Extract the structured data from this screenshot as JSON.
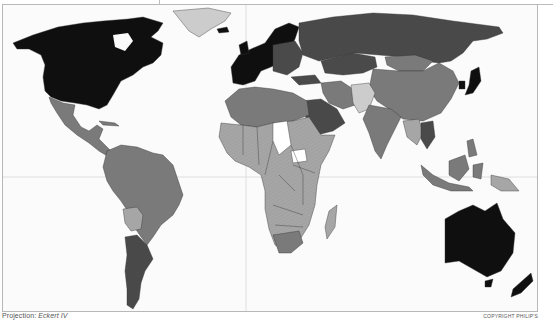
{
  "map": {
    "projection_label": "Projection:",
    "projection_name": "Eckert IV",
    "copyright": "COPYRIGHT PHILIP'S",
    "shading_classes": [
      {
        "id": "c1",
        "color": "#0f0f0f"
      },
      {
        "id": "c2",
        "color": "#4a4a4a"
      },
      {
        "id": "c3",
        "color": "#7a7a7a"
      },
      {
        "id": "c4",
        "color": "#a6a6a6"
      },
      {
        "id": "c5",
        "color": "#cccccc"
      },
      {
        "id": "c6",
        "color": "#ffffff"
      }
    ],
    "regions": [
      {
        "name": "North America (USA & Canada)",
        "class": "c1"
      },
      {
        "name": "Greenland",
        "class": "c5"
      },
      {
        "name": "Western Europe",
        "class": "c1"
      },
      {
        "name": "Russia",
        "class": "c2"
      },
      {
        "name": "Kazakhstan",
        "class": "c2"
      },
      {
        "name": "Mexico & Central America",
        "class": "c3"
      },
      {
        "name": "South America (north)",
        "class": "c3"
      },
      {
        "name": "Brazil",
        "class": "c3"
      },
      {
        "name": "Bolivia",
        "class": "c4"
      },
      {
        "name": "Argentina",
        "class": "c2"
      },
      {
        "name": "North Africa",
        "class": "c3"
      },
      {
        "name": "Sub-Saharan Africa",
        "class": "c4"
      },
      {
        "name": "Chad / Central African Republic",
        "class": "c6"
      },
      {
        "name": "South Africa",
        "class": "c3"
      },
      {
        "name": "Madagascar",
        "class": "c4"
      },
      {
        "name": "Saudi Arabia",
        "class": "c2"
      },
      {
        "name": "Iran",
        "class": "c3"
      },
      {
        "name": "Afghanistan / Pakistan",
        "class": "c5"
      },
      {
        "name": "India",
        "class": "c3"
      },
      {
        "name": "China",
        "class": "c3"
      },
      {
        "name": "Mongolia",
        "class": "c3"
      },
      {
        "name": "Japan / South Korea",
        "class": "c1"
      },
      {
        "name": "Southeast Asia",
        "class": "c3"
      },
      {
        "name": "Thailand",
        "class": "c2"
      },
      {
        "name": "Indonesia",
        "class": "c3"
      },
      {
        "name": "Papua New Guinea",
        "class": "c4"
      },
      {
        "name": "Australia",
        "class": "c1"
      },
      {
        "name": "New Zealand",
        "class": "c1"
      }
    ]
  }
}
